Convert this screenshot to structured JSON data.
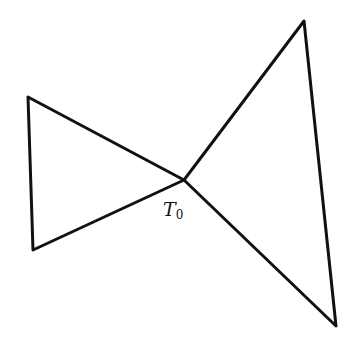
{
  "diagram": {
    "stroke_color": "#111111",
    "stroke_width": 3,
    "center_vertex": {
      "x": 184,
      "y": 180
    },
    "left_triangle": {
      "name": "left-triangle",
      "points": [
        [
          184,
          180
        ],
        [
          28,
          97
        ],
        [
          33,
          250
        ]
      ]
    },
    "right_triangle": {
      "name": "right-triangle",
      "points": [
        [
          184,
          180
        ],
        [
          304,
          21
        ],
        [
          336,
          326
        ]
      ]
    },
    "label": {
      "main": "T",
      "subscript": "0"
    }
  }
}
